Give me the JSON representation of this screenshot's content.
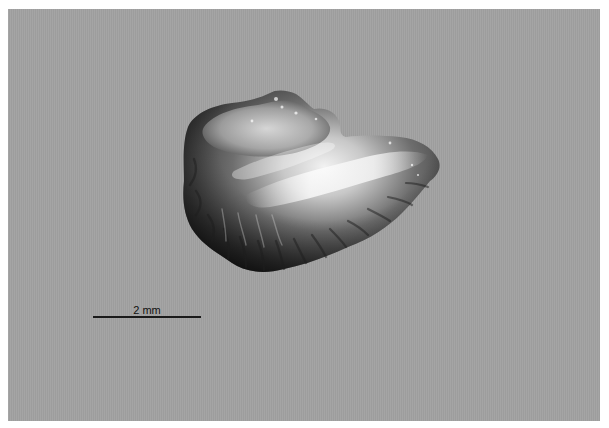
{
  "image": {
    "subject": "specimen-fragment",
    "background_color": "#a2a2a2"
  },
  "scale_bar": {
    "label": "2 mm",
    "color": "#1a1a1a"
  }
}
